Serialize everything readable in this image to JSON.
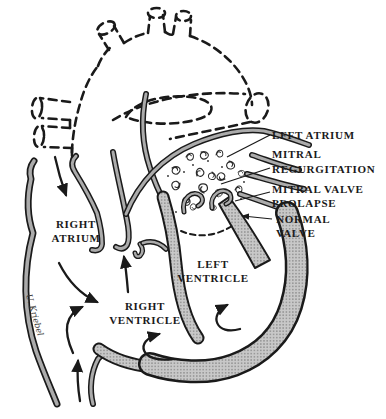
{
  "diagram": {
    "labels": {
      "annotation_left_atrium": "LFFT ATRIUM",
      "annotation_mitral_regurgitation_l1": "MITRAL",
      "annotation_mitral_regurgitation_l2": "REGURGITATION",
      "annotation_mitral_valve_prolapse_l1": "MITRAL VALVE",
      "annotation_mitral_valve_prolapse_l2": "PROLAPSE",
      "annotation_normal_valve_l1": "NORMAL",
      "annotation_normal_valve_l2": "VALVE",
      "chamber_right_atrium_l1": "RIGHT",
      "chamber_right_atrium_l2": "ATRIUM",
      "chamber_left_ventricle_l1": "LEFT",
      "chamber_left_ventricle_l2": "VENTRICLE",
      "chamber_right_ventricle_l1": "RIGHT",
      "chamber_right_ventricle_l2": "VENTRICLE",
      "signature": "U. Kriebel"
    },
    "colors": {
      "ink": "#1a1a1a",
      "thin_wall_gray": "#ababab",
      "muscle_halftone_base": "#c8c8c8",
      "muscle_halftone_dot": "#868686",
      "background": "#ffffff"
    }
  }
}
